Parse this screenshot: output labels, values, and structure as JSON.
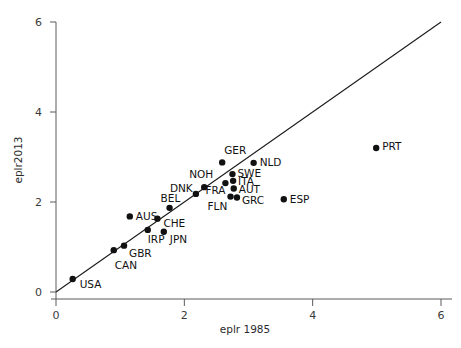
{
  "chart_data": {
    "type": "scatter",
    "title": "",
    "xlabel": "eplr 1985",
    "ylabel": "eplr2013",
    "xlim": [
      0,
      6
    ],
    "ylim": [
      0,
      6
    ],
    "xticks": [
      0,
      2,
      4,
      6
    ],
    "yticks": [
      0,
      2,
      4,
      6
    ],
    "xtick_labels": [
      "0",
      "2",
      "4",
      "6"
    ],
    "ytick_labels": [
      "0",
      "2",
      "4",
      "6"
    ],
    "grid": false,
    "legend": "none",
    "annotations": [
      {
        "name": "identity-line",
        "type": "line",
        "from": [
          0,
          0
        ],
        "to": [
          6,
          6
        ],
        "note": "45-degree reference line y = x"
      }
    ],
    "points": [
      {
        "label": "USA",
        "x": 0.26,
        "y": 0.29,
        "label_dx": 7,
        "label_dy": 9
      },
      {
        "label": "CAN",
        "x": 0.9,
        "y": 0.93,
        "label_dx": 1,
        "label_dy": 19
      },
      {
        "label": "GBR",
        "x": 1.06,
        "y": 1.03,
        "label_dx": 5,
        "label_dy": 11
      },
      {
        "label": "AUS",
        "x": 1.15,
        "y": 1.68,
        "label_dx": 6,
        "label_dy": 4
      },
      {
        "label": "IRP",
        "x": 1.43,
        "y": 1.38,
        "label_dx": 0,
        "label_dy": 13
      },
      {
        "label": "CHE",
        "x": 1.58,
        "y": 1.63,
        "label_dx": 6,
        "label_dy": 8
      },
      {
        "label": "JPN",
        "x": 1.68,
        "y": 1.34,
        "label_dx": 6,
        "label_dy": 11
      },
      {
        "label": "BEL",
        "x": 1.77,
        "y": 1.87,
        "label_dx": -9,
        "label_dy": -6
      },
      {
        "label": "DNK",
        "x": 2.18,
        "y": 2.18,
        "label_dx": -26,
        "label_dy": -2
      },
      {
        "label": "NOH",
        "x": 2.31,
        "y": 2.33,
        "label_dx": -15,
        "label_dy": -9
      },
      {
        "label": "GER",
        "x": 2.59,
        "y": 2.88,
        "label_dx": 2,
        "label_dy": -8
      },
      {
        "label": "FRA",
        "x": 2.64,
        "y": 2.42,
        "label_dx": -20,
        "label_dy": 11
      },
      {
        "label": "SWE",
        "x": 2.75,
        "y": 2.62,
        "label_dx": 5,
        "label_dy": 3
      },
      {
        "label": "ITA",
        "x": 2.76,
        "y": 2.47,
        "label_dx": 5,
        "label_dy": 4
      },
      {
        "label": "AUT",
        "x": 2.77,
        "y": 2.3,
        "label_dx": 5,
        "label_dy": 4
      },
      {
        "label": "FLN",
        "x": 2.72,
        "y": 2.12,
        "label_dx": -23,
        "label_dy": 13
      },
      {
        "label": "GRC",
        "x": 2.82,
        "y": 2.1,
        "label_dx": 5,
        "label_dy": 6
      },
      {
        "label": "NLD",
        "x": 3.08,
        "y": 2.87,
        "label_dx": 6,
        "label_dy": 3
      },
      {
        "label": "ESP",
        "x": 3.55,
        "y": 2.06,
        "label_dx": 6,
        "label_dy": 4
      },
      {
        "label": "PRT",
        "x": 4.99,
        "y": 3.2,
        "label_dx": 6,
        "label_dy": 2
      }
    ]
  },
  "colors": {
    "point": "#111111",
    "line": "#1a1a1a",
    "axis": "#5a5a5a",
    "text": "#111111",
    "background": "#ffffff"
  }
}
